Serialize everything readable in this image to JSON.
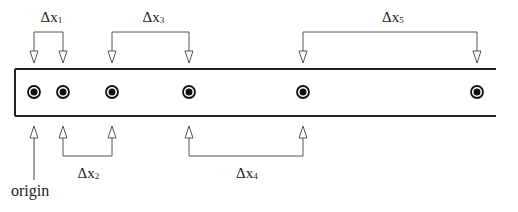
{
  "diagram": {
    "strip": {
      "left": 15,
      "top": 69,
      "right": 496,
      "bottom": 116,
      "open_right": true
    },
    "dots_x": [
      34,
      63,
      112,
      189,
      303,
      477
    ],
    "dot_y": 92,
    "top_intervals": [
      {
        "label_base": "Δx",
        "label_sub": "1",
        "from_x": 34,
        "to_x": 63
      },
      {
        "label_base": "Δx",
        "label_sub": "3",
        "from_x": 112,
        "to_x": 189
      },
      {
        "label_base": "Δx",
        "label_sub": "5",
        "from_x": 303,
        "to_x": 477
      }
    ],
    "bottom_intervals": [
      {
        "label_base": "Δx",
        "label_sub": "2",
        "from_x": 63,
        "to_x": 112
      },
      {
        "label_base": "Δx",
        "label_sub": "4",
        "from_x": 189,
        "to_x": 303
      }
    ],
    "origin": {
      "label": "origin",
      "x": 34
    },
    "colors": {
      "line": "#222222",
      "arrow": "#555555",
      "dot": "#111111"
    }
  }
}
